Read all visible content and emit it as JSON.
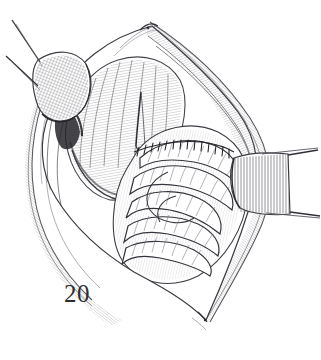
{
  "figure": {
    "number_label": "20",
    "caption": "",
    "medium": "pen-and-ink line drawing",
    "background_color": "#ffffff",
    "ink_color": "#1d1d20",
    "mid_tone_color": "#6b6b70",
    "light_tone_color": "#a9a9ae"
  },
  "structures": {
    "wound_outline": {
      "name": "incision-opening",
      "description": "elongated lens-shaped laparotomy opening, apex at top and bottom"
    },
    "retractor_upper_left": {
      "name": "upper-left-retractor-blade",
      "hatch": "cross-hatch",
      "handle_count": 2
    },
    "retractor_right": {
      "name": "right-retractor-blade",
      "hatch": "vertical-line",
      "handle_count": 2
    },
    "muscle_layer": {
      "name": "muscle-fiber-layer",
      "description": "obliquely hatched muscle bellies on the left half of the field"
    },
    "bowel_loops": {
      "name": "coiled-bowel-loops",
      "loop_count": 5,
      "description": "stacked coils of small intestine filling the right and central field"
    },
    "suture_line": {
      "name": "suture-line",
      "stitch_count": 16,
      "description": "running closure across the upper surface of the bowel mass"
    },
    "wound_edge_left": {
      "name": "left-wound-edge"
    },
    "wound_edge_right": {
      "name": "right-wound-edge"
    },
    "skin_fascia": {
      "name": "skin-and-fascia-margin"
    }
  }
}
